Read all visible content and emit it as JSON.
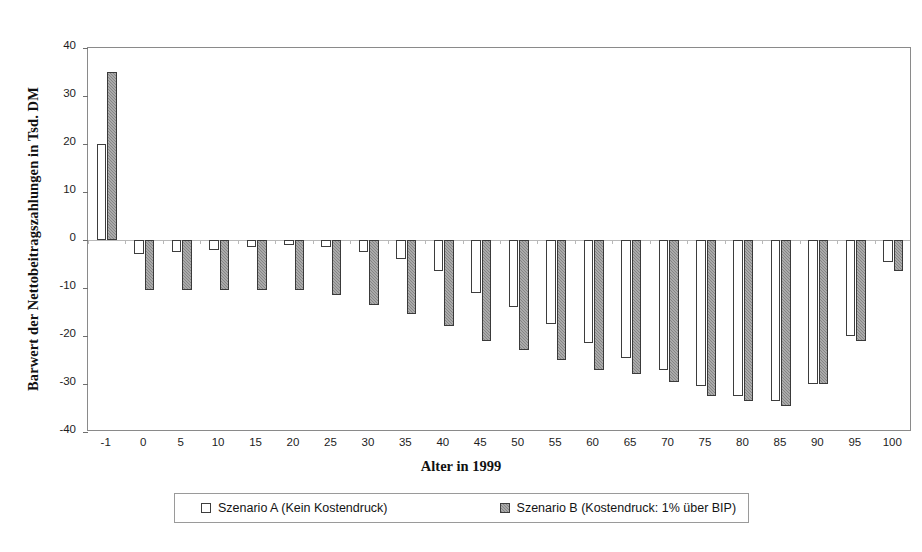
{
  "chart_data": {
    "type": "bar",
    "title": "",
    "xlabel": "Alter in 1999",
    "ylabel": "Barwert der Nettobeitragszahlungen in Tsd. DM",
    "categories": [
      "-1",
      "0",
      "5",
      "10",
      "15",
      "20",
      "25",
      "30",
      "35",
      "40",
      "45",
      "50",
      "55",
      "60",
      "65",
      "70",
      "75",
      "80",
      "85",
      "90",
      "95",
      "100"
    ],
    "ylim": [
      -40,
      40
    ],
    "yticks": [
      40,
      30,
      20,
      10,
      0,
      -10,
      -20,
      -30,
      -40
    ],
    "ytick_labels": [
      "40",
      "30",
      "20",
      "10",
      "0",
      "-10",
      "-20",
      "-30",
      "-40"
    ],
    "grid": false,
    "legend_position": "bottom",
    "series": [
      {
        "name": "Szenario A (Kein Kostendruck)",
        "color": "#ffffff",
        "values": [
          20,
          -3,
          -2.5,
          -2,
          -1.5,
          -1,
          -1.5,
          -2.5,
          -4,
          -6.5,
          -11,
          -14,
          -17.5,
          -21.5,
          -24.5,
          -27,
          -30.5,
          -32.5,
          -33.5,
          -30,
          -20,
          -4.5
        ]
      },
      {
        "name": "Szenario B (Kostendruck: 1% über BIP)",
        "color": "#858585",
        "values": [
          35,
          -10.5,
          -10.5,
          -10.5,
          -10.5,
          -10.5,
          -11.5,
          -13.5,
          -15.5,
          -18,
          -21,
          -23,
          -25,
          -27,
          -28,
          -29.5,
          -32.5,
          -33.5,
          -34.5,
          -30,
          -21,
          -6.5
        ]
      }
    ]
  },
  "legend": {
    "items": [
      {
        "label": "Szenario A (Kein Kostendruck)"
      },
      {
        "label": "Szenario B (Kostendruck: 1% über BIP)"
      }
    ]
  },
  "axes": {
    "x_title": "Alter in 1999",
    "y_title": "Barwert der Nettobeitragszahlungen in Tsd. DM"
  }
}
